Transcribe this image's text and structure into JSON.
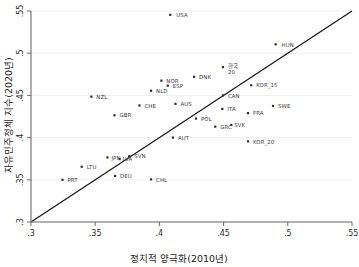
{
  "chart_data": {
    "type": "scatter",
    "title": "",
    "xlabel": "정치적 양극화(2010년)",
    "ylabel": "자유민주정체 지수(2020년)",
    "xlim": [
      0.3,
      0.55
    ],
    "ylim": [
      0.3,
      0.55
    ],
    "xticks": [
      ".3",
      ".35",
      ".4",
      ".45",
      ".5",
      ".55"
    ],
    "yticks": [
      ".3",
      ".35",
      ".4",
      ".45",
      ".5",
      ".55"
    ],
    "xtick_values": [
      0.3,
      0.35,
      0.4,
      0.45,
      0.5,
      0.55
    ],
    "ytick_values": [
      0.3,
      0.35,
      0.4,
      0.45,
      0.5,
      0.55
    ],
    "grid": "horizontal",
    "legend": "none",
    "reference_line": {
      "name": "45-degree line",
      "from": [
        0.3,
        0.3
      ],
      "to": [
        0.55,
        0.55
      ]
    },
    "points": [
      {
        "label": "USA",
        "x": 0.4085,
        "y": 0.5455,
        "lx": 6,
        "ly": 2.2
      },
      {
        "label": "HUN",
        "x": 0.4905,
        "y": 0.5105,
        "lx": 6,
        "ly": 2.2
      },
      {
        "label": "한국",
        "x": 0.4495,
        "y": 0.4835,
        "lx": 5,
        "ly": 1.0,
        "kr": true,
        "line2": "20"
      },
      {
        "label": "DNK",
        "x": 0.427,
        "y": 0.472,
        "lx": 5,
        "ly": 2.2
      },
      {
        "label": "NOR",
        "x": 0.4015,
        "y": 0.4675,
        "lx": 5,
        "ly": 2.2
      },
      {
        "label": "ESP",
        "x": 0.4065,
        "y": 0.4615,
        "lx": 5,
        "ly": 2.2
      },
      {
        "label": "KOR_15",
        "x": 0.4715,
        "y": 0.462,
        "lx": 5,
        "ly": 2.2
      },
      {
        "label": "NLD",
        "x": 0.3935,
        "y": 0.4555,
        "lx": 5,
        "ly": 2.2
      },
      {
        "label": "CAN",
        "x": 0.4495,
        "y": 0.45,
        "lx": 5,
        "ly": 2.2
      },
      {
        "label": "NZL",
        "x": 0.347,
        "y": 0.4485,
        "lx": 5,
        "ly": 2.2
      },
      {
        "label": "AUS",
        "x": 0.4125,
        "y": 0.44,
        "lx": 5,
        "ly": 2.2
      },
      {
        "label": "CHE",
        "x": 0.3845,
        "y": 0.438,
        "lx": 5,
        "ly": 2.2
      },
      {
        "label": "SWE",
        "x": 0.4885,
        "y": 0.4375,
        "lx": 5,
        "ly": 2.2
      },
      {
        "label": "ITA",
        "x": 0.449,
        "y": 0.434,
        "lx": 5,
        "ly": 2.2
      },
      {
        "label": "FRA",
        "x": 0.469,
        "y": 0.429,
        "lx": 5,
        "ly": 2.2
      },
      {
        "label": "GBR",
        "x": 0.365,
        "y": 0.4265,
        "lx": 5,
        "ly": 2.2
      },
      {
        "label": "POL",
        "x": 0.4285,
        "y": 0.4225,
        "lx": 5,
        "ly": 2.2
      },
      {
        "label": "GRC",
        "x": 0.4435,
        "y": 0.413,
        "lx": 5,
        "ly": 2.2
      },
      {
        "label": "SVK",
        "x": 0.456,
        "y": 0.415,
        "lx": 3,
        "ly": 2.2
      },
      {
        "label": "AUT",
        "x": 0.4105,
        "y": 0.4,
        "lx": 5,
        "ly": 2.2
      },
      {
        "label": "KOR_20",
        "x": 0.469,
        "y": 0.3955,
        "lx": 5,
        "ly": 2.2
      },
      {
        "label": "SVN",
        "x": 0.3765,
        "y": 0.378,
        "lx": 5,
        "ly": 2.2
      },
      {
        "label": "JPN",
        "x": 0.3595,
        "y": 0.3765,
        "lx": 4,
        "ly": 2.2
      },
      {
        "label": "LVA",
        "x": 0.369,
        "y": 0.3745,
        "lx": 3,
        "ly": 2.2
      },
      {
        "label": "LTU",
        "x": 0.3395,
        "y": 0.3655,
        "lx": 5,
        "ly": 2.2
      },
      {
        "label": "DEU",
        "x": 0.3655,
        "y": 0.3545,
        "lx": 5,
        "ly": 2.2
      },
      {
        "label": "PRT",
        "x": 0.3245,
        "y": 0.35,
        "lx": 5,
        "ly": 2.2
      },
      {
        "label": "CHL",
        "x": 0.3935,
        "y": 0.3505,
        "lx": 5,
        "ly": 2.2
      }
    ]
  }
}
